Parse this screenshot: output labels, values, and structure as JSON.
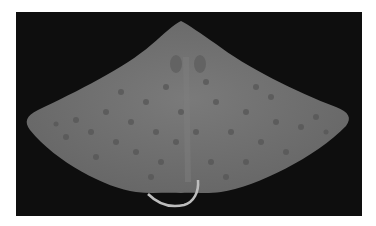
{
  "image": {
    "subject": "ray specimen, dorsal view, on black background",
    "colors": {
      "background": "#0e0e0e",
      "body": "#707070",
      "spots": "#555555",
      "tail": "#bdbdbd"
    }
  }
}
